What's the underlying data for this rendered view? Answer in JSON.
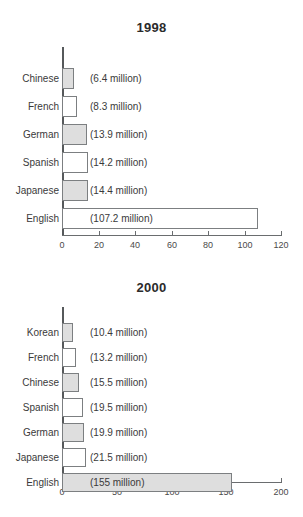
{
  "chart_data": [
    {
      "type": "bar",
      "orientation": "horizontal",
      "title": "1998",
      "xlabel": "",
      "ylabel": "",
      "xlim": [
        0,
        120
      ],
      "xticks": [
        0,
        20,
        40,
        60,
        80,
        100,
        120
      ],
      "xtick_labels": [
        "0",
        "20",
        "40",
        "60",
        "80",
        "100",
        "120"
      ],
      "grid": false,
      "legend": "none",
      "unit": "million",
      "categories": [
        "Chinese",
        "French",
        "German",
        "Spanish",
        "Japanese",
        "English"
      ],
      "values": [
        6.4,
        8.3,
        13.9,
        14.2,
        14.4,
        107.2
      ],
      "value_labels": [
        "(6.4 million)",
        "(8.3 million)",
        "(13.9 million)",
        "(14.2 million)",
        "(14.4 million)",
        "(107.2 million)"
      ],
      "bar_fills": [
        "gray",
        "white",
        "gray",
        "white",
        "gray",
        "white"
      ]
    },
    {
      "type": "bar",
      "orientation": "horizontal",
      "title": "2000",
      "xlabel": "",
      "ylabel": "",
      "xlim": [
        0,
        200
      ],
      "xticks": [
        0,
        50,
        100,
        150,
        200
      ],
      "xtick_labels": [
        "0",
        "50",
        "100",
        "150",
        "200"
      ],
      "grid": false,
      "legend": "none",
      "unit": "million",
      "categories": [
        "Korean",
        "French",
        "Chinese",
        "Spanish",
        "German",
        "Japanese",
        "English"
      ],
      "values": [
        10.4,
        13.2,
        15.5,
        19.5,
        19.9,
        21.5,
        155
      ],
      "value_labels": [
        "(10.4 million)",
        "(13.2 million)",
        "(15.5 million)",
        "(19.5 million)",
        "(19.9 million)",
        "(21.5 million)",
        "(155 million)"
      ],
      "bar_fills": [
        "gray",
        "white",
        "gray",
        "white",
        "gray",
        "white",
        "gray"
      ]
    }
  ],
  "colors": {
    "bar_fill_gray": "#dedede",
    "bar_fill_white": "#ffffff",
    "bar_stroke": "#7c7f81",
    "axis": "#56595b",
    "text": "#3a3a3a",
    "background": "#ffffff"
  }
}
